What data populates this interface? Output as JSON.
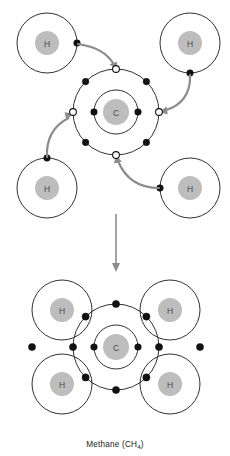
{
  "figure": {
    "caption_text": "Methane (CH",
    "caption_formula_sub": "4",
    "caption_suffix": ")",
    "colors": {
      "background": "#ffffff",
      "shell_stroke": "#1a1a1a",
      "nucleus_fill": "#bdbdbd",
      "nucleus_label": "#4a4a4a",
      "electron_filled": "#111111",
      "electron_empty_fill": "#ffffff",
      "arrow": "#8c8c8c",
      "caption": "#222222"
    }
  },
  "top_panel": {
    "name": "electron-transfer-stage",
    "carbon": {
      "symbol": "C",
      "center_x": 116,
      "center_y": 112,
      "nucleus_radius": 13,
      "inner_shell_radius": 22,
      "outer_shell_radius": 43,
      "inner_electrons": [
        {
          "label": "inner-electron-west",
          "x": 94,
          "y": 112,
          "type": "filled"
        },
        {
          "label": "inner-electron-east",
          "x": 138,
          "y": 112,
          "type": "filled"
        }
      ],
      "outer_electrons": [
        {
          "label": "outer-electron-nw",
          "x": 85.6,
          "y": 81.6,
          "type": "filled"
        },
        {
          "label": "outer-electron-ne",
          "x": 146.4,
          "y": 81.6,
          "type": "filled"
        },
        {
          "label": "outer-electron-sw",
          "x": 85.6,
          "y": 142.4,
          "type": "filled"
        },
        {
          "label": "outer-electron-se",
          "x": 146.4,
          "y": 142.4,
          "type": "filled"
        },
        {
          "label": "vacancy-north",
          "x": 116,
          "y": 69,
          "type": "empty"
        },
        {
          "label": "vacancy-south",
          "x": 116,
          "y": 155,
          "type": "empty"
        },
        {
          "label": "vacancy-west",
          "x": 73,
          "y": 112,
          "type": "empty"
        },
        {
          "label": "vacancy-east",
          "x": 159,
          "y": 112,
          "type": "empty"
        }
      ]
    },
    "hydrogens": [
      {
        "label": "hydrogen-top-left",
        "symbol": "H",
        "center_x": 47,
        "center_y": 43,
        "nucleus_radius": 12,
        "shell_radius": 30,
        "electron": {
          "label": "electron-top-left",
          "x": 77,
          "y": 43
        }
      },
      {
        "label": "hydrogen-top-right",
        "symbol": "H",
        "center_x": 190,
        "center_y": 43,
        "nucleus_radius": 12,
        "shell_radius": 30,
        "electron": {
          "label": "electron-top-right",
          "x": 190,
          "y": 73
        }
      },
      {
        "label": "hydrogen-bottom-left",
        "symbol": "H",
        "center_x": 47,
        "center_y": 188,
        "nucleus_radius": 12,
        "shell_radius": 30,
        "electron": {
          "label": "electron-bottom-left",
          "x": 47,
          "y": 158
        }
      },
      {
        "label": "hydrogen-bottom-right",
        "symbol": "H",
        "center_x": 190,
        "center_y": 188,
        "nucleus_radius": 12,
        "shell_radius": 30,
        "electron": {
          "label": "electron-bottom-right",
          "x": 160,
          "y": 188
        }
      }
    ],
    "transfer_arrows": [
      {
        "label": "arrow-from-top-left-h",
        "from_x": 77,
        "from_y": 43,
        "to_x": 116,
        "to_y": 69
      },
      {
        "label": "arrow-from-top-right-h",
        "from_x": 190,
        "from_y": 73,
        "to_x": 159,
        "to_y": 112
      },
      {
        "label": "arrow-from-bottom-left-h",
        "from_x": 47,
        "from_y": 158,
        "to_x": 73,
        "to_y": 112
      },
      {
        "label": "arrow-from-bottom-right-h",
        "from_x": 160,
        "from_y": 188,
        "to_x": 116,
        "to_y": 155
      }
    ]
  },
  "step_arrow": {
    "label": "downward-process-arrow",
    "x": 116,
    "from_y": 214,
    "to_y": 272
  },
  "bottom_panel": {
    "name": "methane-molecule-stage",
    "carbon": {
      "symbol": "C",
      "center_x": 116,
      "center_y": 347,
      "nucleus_radius": 13,
      "inner_shell_radius": 22,
      "outer_shell_radius": 43,
      "inner_electrons": [
        {
          "label": "inner-electron-west",
          "x": 94,
          "y": 347,
          "type": "filled"
        },
        {
          "label": "inner-electron-east",
          "x": 138,
          "y": 347,
          "type": "filled"
        }
      ],
      "outer_electrons": [
        {
          "label": "bond-pair-nw-carbon",
          "x": 85.6,
          "y": 316.6,
          "type": "filled"
        },
        {
          "label": "bond-pair-ne-carbon",
          "x": 146.4,
          "y": 316.6,
          "type": "filled"
        },
        {
          "label": "bond-pair-sw-carbon",
          "x": 85.6,
          "y": 377.4,
          "type": "filled"
        },
        {
          "label": "bond-pair-se-carbon",
          "x": 146.4,
          "y": 377.4,
          "type": "filled"
        },
        {
          "label": "shared-electron-north",
          "x": 116,
          "y": 304,
          "type": "filled"
        },
        {
          "label": "shared-electron-south",
          "x": 116,
          "y": 390,
          "type": "filled"
        },
        {
          "label": "shared-electron-west",
          "x": 73,
          "y": 347,
          "type": "filled"
        },
        {
          "label": "shared-electron-east",
          "x": 159,
          "y": 347,
          "type": "filled"
        }
      ]
    },
    "hydrogens": [
      {
        "label": "hydrogen-top-left",
        "symbol": "H",
        "center_x": 62,
        "center_y": 310,
        "nucleus_radius": 12,
        "shell_radius": 30,
        "outer_electron": {
          "label": "h-electron-top-left",
          "x": 58,
          "y": 347
        }
      },
      {
        "label": "hydrogen-top-right",
        "symbol": "H",
        "center_x": 170,
        "center_y": 310,
        "nucleus_radius": 12,
        "shell_radius": 30,
        "outer_electron": {
          "label": "h-electron-top-right",
          "x": 174,
          "y": 347
        }
      },
      {
        "label": "hydrogen-bottom-left",
        "symbol": "H",
        "center_x": 62,
        "center_y": 384,
        "nucleus_radius": 12,
        "shell_radius": 30,
        "outer_electron": {
          "label": "h-electron-bottom-left",
          "x": 58,
          "y": 347
        }
      },
      {
        "label": "hydrogen-bottom-right",
        "symbol": "H",
        "center_x": 170,
        "center_y": 384,
        "nucleus_radius": 12,
        "shell_radius": 30,
        "outer_electron": {
          "label": "h-electron-bottom-right",
          "x": 174,
          "y": 347
        }
      }
    ]
  }
}
